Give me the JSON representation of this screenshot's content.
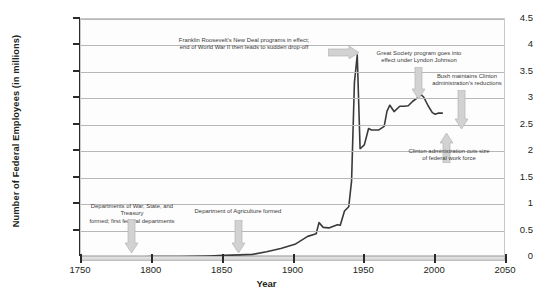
{
  "chart_data": {
    "type": "line",
    "title": "",
    "xlabel": "Year",
    "ylabel": "Number of Federal Employees (in millions)",
    "xlim": [
      1750,
      2050
    ],
    "ylim": [
      0,
      4.5
    ],
    "xticks": [
      1750,
      1800,
      1850,
      1900,
      1950,
      2000,
      2050
    ],
    "yticks": [
      0,
      0.5,
      1,
      1.5,
      2,
      2.5,
      3,
      3.5,
      4,
      4.5
    ],
    "grid": true,
    "legend": "none",
    "line_color": "#3a3a3a",
    "arrow_color": "#c9c9c9",
    "series": [
      {
        "name": "Federal civilian employees",
        "x": [
          1750,
          1790,
          1800,
          1820,
          1840,
          1851,
          1862,
          1871,
          1881,
          1891,
          1901,
          1910,
          1916,
          1918,
          1921,
          1925,
          1931,
          1933,
          1936,
          1939,
          1941,
          1943,
          1945,
          1947,
          1948,
          1950,
          1953,
          1955,
          1960,
          1964,
          1966,
          1968,
          1971,
          1975,
          1978,
          1981,
          1984,
          1987,
          1990,
          1992,
          1995,
          1998,
          2000,
          2002,
          2005
        ],
        "values": [
          0.0,
          0.0,
          0.01,
          0.01,
          0.02,
          0.03,
          0.04,
          0.05,
          0.1,
          0.16,
          0.24,
          0.39,
          0.44,
          0.65,
          0.56,
          0.55,
          0.61,
          0.6,
          0.87,
          0.95,
          1.44,
          3.3,
          3.82,
          2.05,
          2.07,
          2.12,
          2.43,
          2.4,
          2.4,
          2.47,
          2.76,
          2.87,
          2.75,
          2.85,
          2.85,
          2.86,
          2.94,
          3.0,
          3.07,
          3.02,
          2.86,
          2.73,
          2.7,
          2.72,
          2.72
        ]
      }
    ],
    "annotations": [
      {
        "id": "new-deal",
        "text": "Franklin Roosevelt's New Deal programs in effect;\nend of World War II then leads to sudden drop-off",
        "line1": "Franklin Roosevelt's New Deal programs in effect;",
        "line2": "end of World War II then leads to sudden drop-off",
        "arrow_direction": "right"
      },
      {
        "id": "great-society",
        "text": "Great Society program goes into\neffect under Lyndon Johnson",
        "line1": "Great Society program goes into",
        "line2": "effect under Lyndon Johnson",
        "arrow_direction": "down"
      },
      {
        "id": "bush-maintains",
        "text": "Bush maintains Clinton\nadministration's reductions",
        "line1": "Bush maintains Clinton",
        "line2": "administration's reductions",
        "arrow_direction": "down"
      },
      {
        "id": "clinton-cuts",
        "text": "Clinton administration cuts size\nof federal work force",
        "line1": "Clinton administration cuts size",
        "line2": "of federal work force",
        "arrow_direction": "up"
      },
      {
        "id": "first-departments",
        "text": "Departments of War, State, and Treasury\nformed; first federal departments",
        "line1": "Departments of War, State, and Treasury",
        "line2": "formed; first federal departments",
        "arrow_direction": "down"
      },
      {
        "id": "agriculture",
        "text": "Department of Agriculture formed",
        "line1": "Department of Agriculture formed",
        "line2": "",
        "arrow_direction": "down"
      }
    ]
  }
}
